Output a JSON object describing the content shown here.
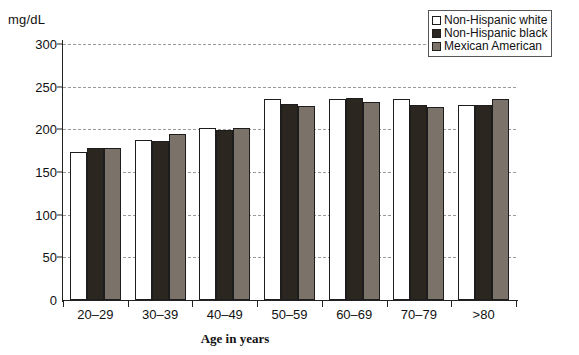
{
  "chart_data": {
    "type": "bar",
    "title": "",
    "xlabel": "Age in years",
    "ylabel": "mg/dL",
    "ylim": [
      0,
      300
    ],
    "yticks": [
      0,
      50,
      100,
      150,
      200,
      250,
      300
    ],
    "grid": true,
    "legend_position": "top-right",
    "categories": [
      "20–29",
      "30–39",
      "40–49",
      "50–59",
      "60–69",
      "70–79",
      ">80"
    ],
    "series": [
      {
        "name": "Non-Hispanic white",
        "color": "#ffffff",
        "values": [
          173,
          188,
          201,
          235,
          236,
          236,
          229
        ]
      },
      {
        "name": "Non-Hispanic black",
        "color": "#2b2620",
        "values": [
          178,
          186,
          199,
          230,
          237,
          229,
          229
        ]
      },
      {
        "name": "Mexican American",
        "color": "#7b736a",
        "values": [
          178,
          195,
          202,
          227,
          232,
          226,
          236
        ]
      }
    ]
  },
  "axes": {
    "y_title": "mg/dL",
    "x_title": "Age in years"
  },
  "legend": {
    "entries": [
      {
        "label": "Non-Hispanic white"
      },
      {
        "label": "Non-Hispanic black"
      },
      {
        "label": "Mexican American"
      }
    ]
  }
}
